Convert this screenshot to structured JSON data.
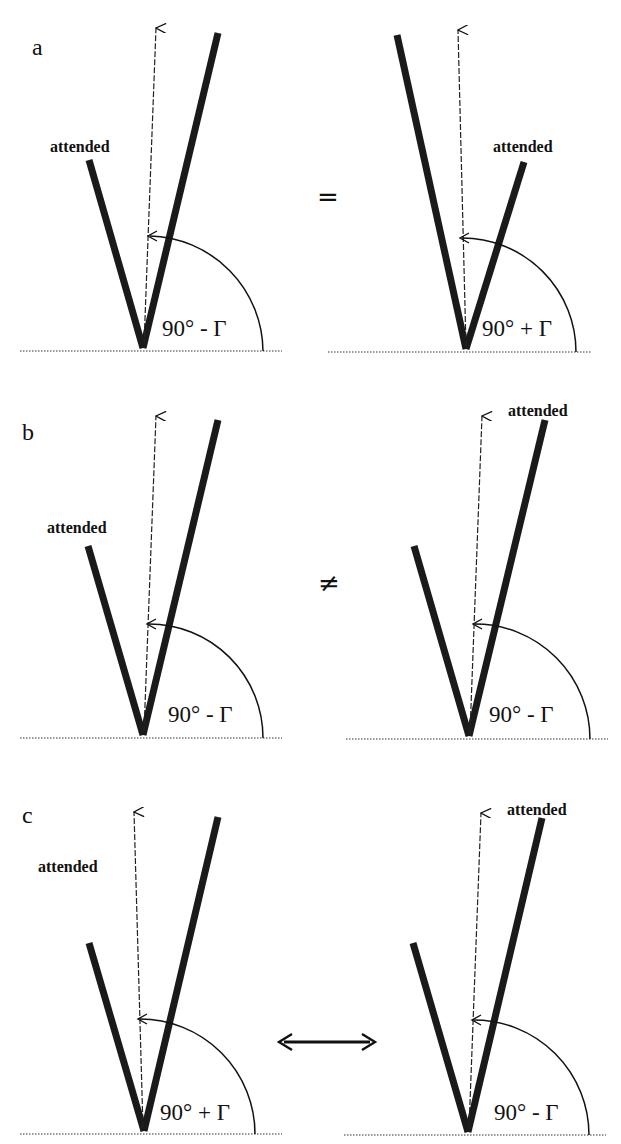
{
  "figure": {
    "panels": [
      {
        "label": "a",
        "relation": "=",
        "left": {
          "attended_label": "attended",
          "angle_label": "90° - Γ",
          "attended_side": "left-short"
        },
        "right": {
          "attended_label": "attended",
          "angle_label": "90° + Γ",
          "attended_side": "right-short"
        }
      },
      {
        "label": "b",
        "relation": "≠",
        "left": {
          "attended_label": "attended",
          "angle_label": "90° - Γ",
          "attended_side": "left-short"
        },
        "right": {
          "attended_label": "attended",
          "angle_label": "90° - Γ",
          "attended_side": "right-long"
        }
      },
      {
        "label": "c",
        "relation": "↔",
        "left": {
          "attended_label": "attended",
          "angle_label": "90° + Γ",
          "attended_side": "above-left"
        },
        "right": {
          "attended_label": "attended",
          "angle_label": "90° - Γ",
          "attended_side": "right-long"
        }
      }
    ]
  }
}
